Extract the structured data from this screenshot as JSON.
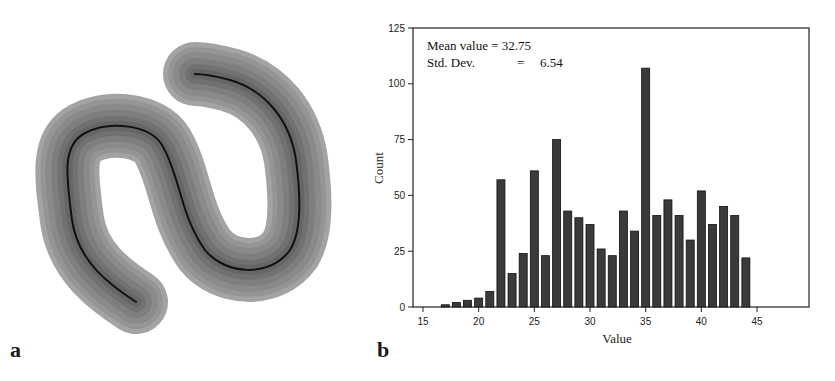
{
  "panels": {
    "a": {
      "label": "a",
      "description": "worm-shaped binary mask with distance-transform bands and centerline skeleton"
    },
    "b": {
      "label": "b"
    }
  },
  "stats": {
    "mean_label": "Mean value",
    "mean_eq": "=",
    "mean_value": "32.75",
    "std_label": "Std. Dev.",
    "std_eq": "=",
    "std_value": "6.54"
  },
  "colors": {
    "bar_fill": "#3a3a3a",
    "bar_stroke": "#111111",
    "worm_outer": "#8c8c8c",
    "worm_inner": "#6e6e6e",
    "skeleton": "#111111"
  },
  "chart_data": {
    "type": "bar",
    "title": "",
    "xlabel": "Value",
    "ylabel": "Count",
    "xlim": [
      15,
      48
    ],
    "ylim": [
      0,
      125
    ],
    "xticks": [
      15,
      20,
      25,
      30,
      35,
      40,
      45
    ],
    "yticks": [
      0,
      25,
      50,
      75,
      100,
      125
    ],
    "grid": false,
    "legend": null,
    "annotations": [
      "Mean value = 32.75",
      "Std. Dev.    =   6.54"
    ],
    "categories": [
      17,
      18,
      19,
      20,
      21,
      22,
      23,
      24,
      25,
      26,
      27,
      28,
      29,
      30,
      31,
      32,
      33,
      34,
      35,
      36,
      37,
      38,
      39,
      40,
      41,
      42,
      43,
      44
    ],
    "values": [
      1,
      2,
      3,
      4,
      7,
      57,
      15,
      24,
      61,
      23,
      75,
      43,
      40,
      37,
      26,
      23,
      43,
      34,
      107,
      41,
      48,
      41,
      30,
      52,
      37,
      45,
      41,
      22
    ]
  }
}
